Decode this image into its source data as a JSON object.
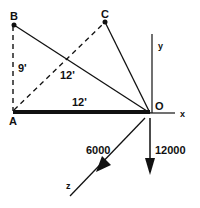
{
  "diagram": {
    "points": {
      "A": {
        "label": "A"
      },
      "B": {
        "label": "B"
      },
      "C": {
        "label": "C"
      },
      "O": {
        "label": "O"
      }
    },
    "axes": {
      "x": "x",
      "y": "y",
      "z": "z"
    },
    "dimensions": {
      "AB": "9'",
      "BO": "12'",
      "AO": "12'"
    },
    "forces": {
      "along_z": "6000",
      "downward": "12000"
    }
  }
}
